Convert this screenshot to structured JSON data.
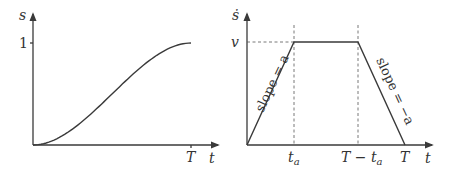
{
  "left_plot": {
    "y_label": "s",
    "x_label": "t",
    "y_tick_label": "1",
    "x_tick_label": "T",
    "curve": "smooth S-shaped rise from 0 at t=0 to 1 at t=T"
  },
  "right_plot": {
    "y_label": "ṡ",
    "x_label": "t",
    "y_tick_label": "v",
    "x_tick_labels": {
      "ta_main": "t",
      "ta_sub": "a",
      "T_minus_ta_main": "T − t",
      "T_minus_ta_sub": "a",
      "T": "T"
    },
    "slope_up_label": "slope = a",
    "slope_down_label": "slope = −a",
    "profile": "trapezoidal: linear rise to v at t_a, constant v until T − t_a, linear fall to 0 at T"
  },
  "chart_data": [
    {
      "type": "line",
      "title": "",
      "xlabel": "t",
      "ylabel": "s",
      "x_ticks": [
        "T"
      ],
      "y_ticks": [
        "1"
      ],
      "x": [
        0,
        0.1,
        0.2,
        0.3,
        0.4,
        0.5,
        0.6,
        0.7,
        0.8,
        0.9,
        1.0
      ],
      "y": [
        0,
        0.028,
        0.104,
        0.216,
        0.352,
        0.5,
        0.648,
        0.784,
        0.896,
        0.972,
        1.0
      ],
      "x_units": "fraction of T",
      "ylim": [
        0,
        1.3
      ]
    },
    {
      "type": "line",
      "title": "",
      "xlabel": "t",
      "ylabel": "ṡ",
      "x_ticks": [
        "t_a",
        "T − t_a",
        "T"
      ],
      "y_ticks": [
        "v"
      ],
      "x": [
        0,
        0.3,
        0.7,
        1.0
      ],
      "y": [
        0,
        1,
        1,
        0
      ],
      "x_units": "fraction of T (t_a ≈ 0.3T)",
      "y_units": "fraction of v",
      "annotations": [
        "slope = a",
        "slope = −a"
      ],
      "ylim": [
        0,
        1.3
      ]
    }
  ]
}
